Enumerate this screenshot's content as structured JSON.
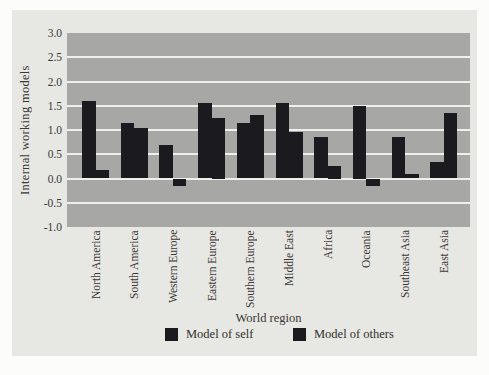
{
  "figure": {
    "panel_bg": "#e7e7e4",
    "page_bg": "#fcfcfa",
    "text_color": "#3b3834"
  },
  "chart_data": {
    "type": "bar",
    "title": "",
    "xlabel": "World region",
    "ylabel": "Internal working models",
    "ylim": [
      -1.0,
      3.0
    ],
    "yticks": [
      3.0,
      2.5,
      2.0,
      1.5,
      1.0,
      0.5,
      0.0,
      -0.5,
      -1.0
    ],
    "ytick_labels": [
      "3.0",
      "2.5",
      "2.0",
      "1.5",
      "1.0",
      "0.5",
      "0.0",
      "-0.5",
      "-1.0"
    ],
    "grid": true,
    "gridline_values": [
      2.5,
      2.0,
      1.5,
      1.0,
      0.5,
      0.0,
      -0.5
    ],
    "plot_bg": "#a7a7a5",
    "gridline_color": "#efefeb",
    "bar_color": "#1b1b1f",
    "legend_position": "bottom",
    "categories": [
      "North America",
      "South America",
      "Western Europe",
      "Eastern Europe",
      "Southern Europe",
      "Middle East",
      "Africa",
      "Oceania",
      "Southeast Asia",
      "East Asia"
    ],
    "series": [
      {
        "name": "Model of self",
        "values": [
          1.6,
          1.15,
          0.7,
          1.55,
          1.15,
          1.55,
          0.85,
          1.5,
          0.85,
          0.35
        ]
      },
      {
        "name": "Model of others",
        "values": [
          0.18,
          1.05,
          -0.15,
          1.25,
          1.3,
          0.95,
          0.25,
          -0.15,
          0.1,
          1.35
        ]
      }
    ]
  }
}
